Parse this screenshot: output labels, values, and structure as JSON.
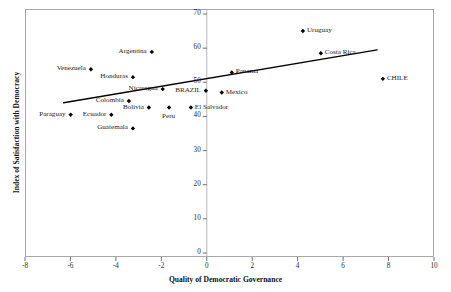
{
  "chart_data": {
    "type": "scatter",
    "title": "",
    "xlabel": "Quality of Democratic Governance",
    "ylabel": "Index of Satisfaction with Democracy",
    "xlim": [
      -8,
      10
    ],
    "ylim": [
      0,
      70
    ],
    "xticks": [
      -8,
      -6,
      -4,
      -2,
      0,
      2,
      4,
      6,
      8,
      10
    ],
    "yticks": [
      0,
      10,
      20,
      30,
      40,
      50,
      60,
      70
    ],
    "xtick_labels": [
      "-8",
      "-6",
      "-4",
      "-2",
      "0",
      "2",
      "4",
      "6",
      "8",
      "10"
    ],
    "ytick_labels": [
      "0",
      "10",
      "20",
      "30",
      "40",
      "50",
      "60",
      "70"
    ],
    "grid": false,
    "legend": "none",
    "y_axis_position_x": 0,
    "marker": "diamond",
    "marker_color": "#000000",
    "points": [
      {
        "label": "Argentina",
        "x": -2.42,
        "y": 58.9,
        "label_side": "left"
      },
      {
        "label": "Venezuela",
        "x": -5.1,
        "y": 53.8,
        "label_side": "left"
      },
      {
        "label": "Honduras",
        "x": -3.25,
        "y": 51.5,
        "label_side": "left"
      },
      {
        "label": "Nicaragua",
        "x": -1.94,
        "y": 48.0,
        "label_side": "left"
      },
      {
        "label": "BRAZIL",
        "x": -0.04,
        "y": 47.5,
        "label_side": "left"
      },
      {
        "label": "Panama",
        "x": 1.1,
        "y": 52.9,
        "label_side": "right"
      },
      {
        "label": "Mexico",
        "x": 0.66,
        "y": 47.0,
        "label_side": "right"
      },
      {
        "label": "Uruguay",
        "x": 4.23,
        "y": 65.0,
        "label_side": "right"
      },
      {
        "label": "Costa Rica",
        "x": 5.02,
        "y": 58.5,
        "label_side": "right"
      },
      {
        "label": "CHILE",
        "x": 7.75,
        "y": 51.0,
        "label_side": "right"
      },
      {
        "label": "Colombia",
        "x": -3.43,
        "y": 44.5,
        "label_side": "left"
      },
      {
        "label": "Bolivia",
        "x": -2.55,
        "y": 42.6,
        "label_side": "left"
      },
      {
        "label": "El Salvador",
        "x": -0.7,
        "y": 42.6,
        "label_side": "right"
      },
      {
        "label": "Peru",
        "x": -1.66,
        "y": 42.6,
        "label_side": "below"
      },
      {
        "label": "Paraguay",
        "x": -5.99,
        "y": 40.5,
        "label_side": "left"
      },
      {
        "label": "Ecuador",
        "x": -4.2,
        "y": 40.5,
        "label_side": "left"
      },
      {
        "label": "Guatemala",
        "x": -3.25,
        "y": 36.5,
        "label_side": "left"
      }
    ],
    "trendline": {
      "x_start": -6.3,
      "y_start": 44.0,
      "x_end": 7.5,
      "y_end": 59.5,
      "color": "#000000",
      "width": 1.4
    }
  }
}
